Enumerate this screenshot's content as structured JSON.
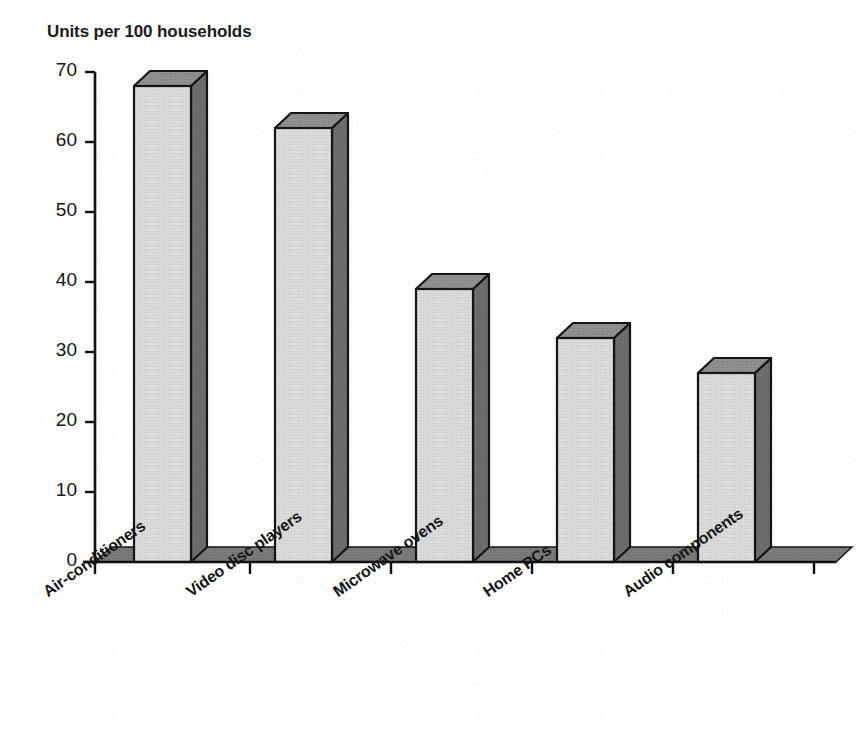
{
  "chart_data": {
    "type": "bar",
    "title": "Units per 100 households",
    "subtitle": "",
    "xlabel": "",
    "ylabel": "",
    "categories": [
      "Air-conditioners",
      "Video disc players",
      "Microwave ovens",
      "Home PCs",
      "Audio components"
    ],
    "values": [
      68,
      62,
      39,
      32,
      27
    ],
    "ylim": [
      0,
      70
    ],
    "yticks": [
      0,
      10,
      20,
      30,
      40,
      50,
      60,
      70
    ],
    "ytick_labels": [
      "0",
      "10",
      "20",
      "30",
      "40",
      "50",
      "60",
      "70"
    ],
    "grid": false,
    "legend": "none",
    "style": "3d-blocks-grayscale",
    "colors": {
      "bar_front": "#d6d6d6",
      "bar_top": "#8c8c8c",
      "bar_side": "#6b6b6b",
      "bar_outline": "#141414",
      "floor": "#767676",
      "axis": "#101010",
      "background": "#fdfdfd",
      "text": "#151515"
    }
  },
  "axes": {
    "y_axis_name": "value-axis",
    "x_axis_name": "category-axis"
  }
}
